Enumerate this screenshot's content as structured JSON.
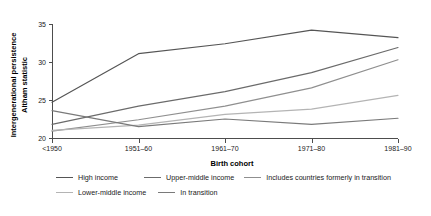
{
  "chart_data": {
    "type": "line",
    "title": "",
    "xlabel": "Birth cohort",
    "ylabel": "Intergenerational persistence\nAltham statistic",
    "ylabel_line1": "Intergenerational persistence",
    "ylabel_line2": "Altham statistic",
    "categories": [
      "<1950",
      "1951–60",
      "1961–70",
      "1971–80",
      "1981–90"
    ],
    "ylim": [
      19.4,
      35.4
    ],
    "yticks": [
      20,
      25,
      30,
      35
    ],
    "ytick_labels": [
      "20",
      "25",
      "30",
      "35"
    ],
    "grid": false,
    "legend_position": "bottom",
    "series": [
      {
        "name": "High income",
        "color": "#555555",
        "values": [
          24.7,
          31.1,
          32.4,
          34.2,
          33.2
        ]
      },
      {
        "name": "Upper-middle income",
        "color": "#6b6b6b",
        "values": [
          21.8,
          24.2,
          26.1,
          28.6,
          31.9
        ]
      },
      {
        "name": "Includes countries formerly in transition",
        "color": "#8f8f8f",
        "values": [
          20.9,
          22.4,
          24.2,
          26.6,
          30.3
        ]
      },
      {
        "name": "Lower-middle income",
        "color": "#b4b4b4",
        "values": [
          21.0,
          21.7,
          23.1,
          23.8,
          25.6
        ]
      },
      {
        "name": "In transition",
        "color": "#7a7a7a",
        "values": [
          23.6,
          21.5,
          22.5,
          21.8,
          22.6
        ]
      }
    ]
  }
}
